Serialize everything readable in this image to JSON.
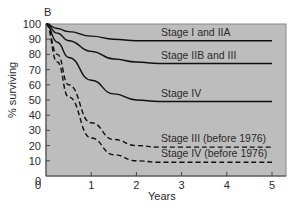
{
  "chart_data": {
    "type": "line",
    "panel_label": "B",
    "title": "",
    "xlabel": "Years",
    "ylabel": "% surviving",
    "xlim": [
      0,
      5
    ],
    "ylim": [
      0,
      100
    ],
    "x_ticks": [
      "0",
      "1",
      "2",
      "3",
      "4",
      "5"
    ],
    "y_ticks": [
      "0",
      "10",
      "20",
      "30",
      "40",
      "50",
      "60",
      "70",
      "80",
      "90",
      "100"
    ],
    "grid": false,
    "legend_position": "inline labels above curves",
    "background": "#bdbdbd",
    "x": [
      0,
      0.25,
      0.5,
      1,
      1.5,
      2,
      2.5,
      3,
      4,
      5
    ],
    "series": [
      {
        "name": "Stage I and IIA",
        "style": "solid",
        "values": [
          100,
          97,
          95,
          92,
          90,
          89,
          89,
          89,
          89,
          89
        ]
      },
      {
        "name": "Stage IIB and III",
        "style": "solid",
        "values": [
          100,
          94,
          89,
          82,
          77,
          75,
          74,
          74,
          74,
          74
        ]
      },
      {
        "name": "Stage IV",
        "style": "solid",
        "values": [
          100,
          88,
          78,
          63,
          54,
          50,
          49,
          49,
          49,
          49
        ]
      },
      {
        "name": "Stage III (before 1976)",
        "style": "dashed",
        "values": [
          100,
          80,
          60,
          35,
          24,
          20,
          19,
          19,
          19,
          19
        ]
      },
      {
        "name": "Stage IV (before 1976)",
        "style": "dashed",
        "values": [
          100,
          75,
          52,
          25,
          14,
          10,
          9,
          9,
          9,
          9
        ]
      }
    ]
  }
}
